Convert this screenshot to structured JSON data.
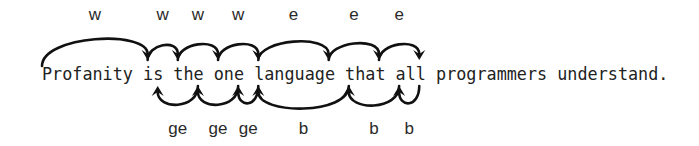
{
  "sentence": "Profanity is the one language that all programmers understand.",
  "char_width": 10.06,
  "text_x": 42,
  "text_baseline": 80,
  "motions": {
    "w": {
      "label": "w",
      "description": "forward to start of next word",
      "arrows": [
        {
          "from_char": 0,
          "to_char": 10,
          "label": "w"
        },
        {
          "from_char": 10,
          "to_char": 13,
          "label": "w"
        },
        {
          "from_char": 13,
          "to_char": 17,
          "label": "w"
        },
        {
          "from_char": 17,
          "to_char": 21,
          "label": "w"
        }
      ]
    },
    "e": {
      "label": "e",
      "description": "forward to end of word",
      "arrows": [
        {
          "from_char": 21,
          "to_char": 28,
          "label": "e"
        },
        {
          "from_char": 28,
          "to_char": 33,
          "label": "e"
        },
        {
          "from_char": 33,
          "to_char": 37,
          "label": "e"
        }
      ]
    },
    "ge": {
      "label": "ge",
      "description": "backward to end of previous word",
      "arrows": [
        {
          "from_char": 15,
          "to_char": 11,
          "label": "ge"
        },
        {
          "from_char": 19,
          "to_char": 15,
          "label": "ge"
        },
        {
          "from_char": 21,
          "to_char": 19,
          "label": "ge"
        }
      ]
    },
    "b": {
      "label": "b",
      "description": "backward to start of word",
      "arrows": [
        {
          "from_char": 30,
          "to_char": 21,
          "label": "b"
        },
        {
          "from_char": 35,
          "to_char": 30,
          "label": "b"
        },
        {
          "from_char": 37,
          "to_char": 35,
          "label": "b"
        }
      ]
    }
  },
  "labels": {
    "top": [
      "w",
      "w",
      "w",
      "w",
      "e",
      "e",
      "e"
    ],
    "bottom": [
      "ge",
      "ge",
      "ge",
      "b",
      "b",
      "b"
    ]
  }
}
